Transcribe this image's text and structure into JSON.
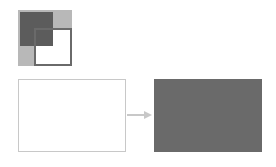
{
  "diagram": {
    "type": "transformation",
    "icon": {
      "name": "overlapping-squares-icon",
      "colors": {
        "dark": "#5c5c5c",
        "light": "#b8b8b8",
        "frame": "#6a6a6a"
      }
    },
    "source": {
      "label": "",
      "fill": "#ffffff",
      "border": "#c8c8c8"
    },
    "arrow": {
      "color": "#c8c8c8",
      "direction": "right"
    },
    "target": {
      "label": "",
      "fill": "#6a6a6a"
    }
  }
}
